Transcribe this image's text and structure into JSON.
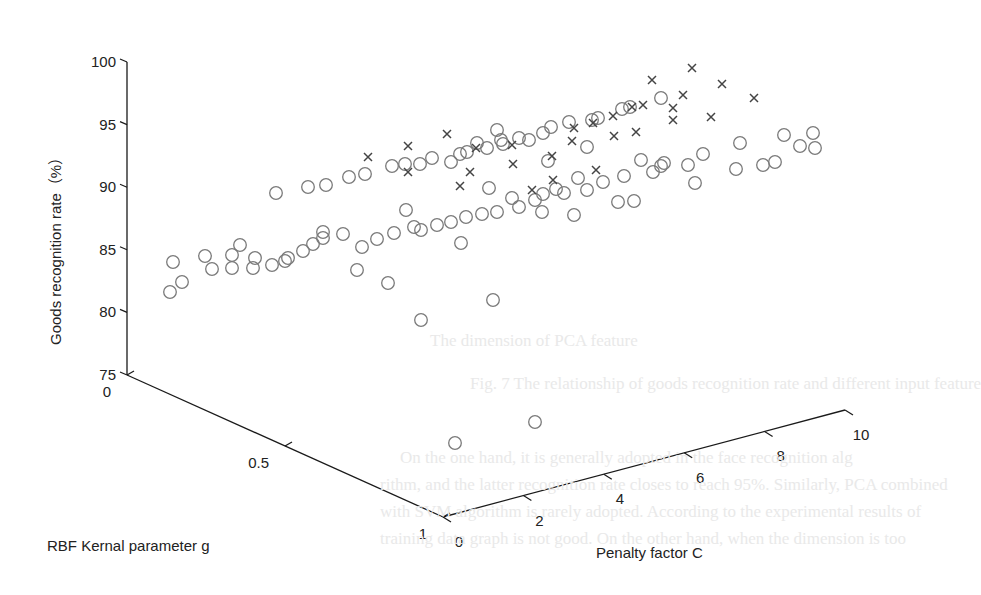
{
  "chart_data": {
    "type": "scatter",
    "projection": "3d",
    "title": "",
    "xlabel": "Penalty factor C",
    "ylabel": "RBF Kernal parameter g",
    "zlabel": "Goods recognition rate（%）",
    "x_ticks": [
      "0",
      "2",
      "4",
      "6",
      "8",
      "10"
    ],
    "y_ticks": [
      "0",
      "0.5",
      "1"
    ],
    "z_ticks": [
      "75",
      "80",
      "85",
      "90",
      "95",
      "100"
    ],
    "xlim": [
      0,
      10
    ],
    "ylim": [
      0,
      1
    ],
    "zlim": [
      75,
      100
    ],
    "grid": false,
    "legend": null,
    "marker_colors": {
      "circle": "#7a7a7a",
      "cross": "#444444",
      "axis": "#1a1a1a"
    },
    "series": [
      {
        "name": "circle-markers",
        "marker": "o",
        "screen_points": [
          [
            170,
            292
          ],
          [
            173,
            262
          ],
          [
            182,
            282
          ],
          [
            205,
            256
          ],
          [
            212,
            269
          ],
          [
            232,
            255
          ],
          [
            232,
            268
          ],
          [
            240,
            245
          ],
          [
            253,
            268
          ],
          [
            255,
            258
          ],
          [
            272,
            265
          ],
          [
            285,
            261
          ],
          [
            288,
            258
          ],
          [
            303,
            251
          ],
          [
            313,
            244
          ],
          [
            323,
            238
          ],
          [
            323,
            232
          ],
          [
            343,
            234
          ],
          [
            357,
            270
          ],
          [
            362,
            247
          ],
          [
            377,
            239
          ],
          [
            388,
            283
          ],
          [
            394,
            233
          ],
          [
            406,
            210
          ],
          [
            414,
            227
          ],
          [
            421,
            230
          ],
          [
            437,
            225
          ],
          [
            451,
            222
          ],
          [
            461,
            243
          ],
          [
            466,
            217
          ],
          [
            482,
            214
          ],
          [
            489,
            188
          ],
          [
            497,
            212
          ],
          [
            512,
            198
          ],
          [
            519,
            207
          ],
          [
            535,
            200
          ],
          [
            542,
            212
          ],
          [
            543,
            194
          ],
          [
            556,
            189
          ],
          [
            564,
            193
          ],
          [
            574,
            215
          ],
          [
            578,
            178
          ],
          [
            587,
            190
          ],
          [
            603,
            182
          ],
          [
            618,
            202
          ],
          [
            624,
            176
          ],
          [
            634,
            201
          ],
          [
            641,
            160
          ],
          [
            653,
            172
          ],
          [
            661,
            166
          ],
          [
            664,
            163
          ],
          [
            688,
            165
          ],
          [
            695,
            183
          ],
          [
            703,
            154
          ],
          [
            736,
            169
          ],
          [
            740,
            143
          ],
          [
            763,
            165
          ],
          [
            775,
            162
          ],
          [
            784,
            135
          ],
          [
            800,
            146
          ],
          [
            813,
            133
          ],
          [
            815,
            148
          ],
          [
            276,
            193
          ],
          [
            308,
            187
          ],
          [
            326,
            185
          ],
          [
            349,
            177
          ],
          [
            365,
            174
          ],
          [
            392,
            166
          ],
          [
            405,
            164
          ],
          [
            420,
            164
          ],
          [
            432,
            158
          ],
          [
            451,
            162
          ],
          [
            460,
            154
          ],
          [
            467,
            152
          ],
          [
            477,
            143
          ],
          [
            487,
            148
          ],
          [
            501,
            140
          ],
          [
            503,
            144
          ],
          [
            519,
            138
          ],
          [
            529,
            140
          ],
          [
            543,
            133
          ],
          [
            551,
            127
          ],
          [
            569,
            122
          ],
          [
            592,
            120
          ],
          [
            598,
            118
          ],
          [
            622,
            109
          ],
          [
            630,
            107
          ],
          [
            661,
            98
          ],
          [
            587,
            147
          ],
          [
            548,
            161
          ],
          [
            497,
            130
          ],
          [
            493,
            300
          ],
          [
            421,
            320
          ],
          [
            455,
            443
          ],
          [
            535,
            422
          ]
        ]
      },
      {
        "name": "cross-markers",
        "marker": "x",
        "screen_points": [
          [
            368,
            157
          ],
          [
            408,
            172
          ],
          [
            408,
            146
          ],
          [
            447,
            134
          ],
          [
            460,
            186
          ],
          [
            470,
            172
          ],
          [
            476,
            148
          ],
          [
            512,
            145
          ],
          [
            513,
            164
          ],
          [
            532,
            190
          ],
          [
            552,
            156
          ],
          [
            553,
            180
          ],
          [
            574,
            128
          ],
          [
            572,
            141
          ],
          [
            593,
            123
          ],
          [
            613,
            116
          ],
          [
            614,
            136
          ],
          [
            632,
            107
          ],
          [
            636,
            132
          ],
          [
            652,
            80
          ],
          [
            643,
            105
          ],
          [
            673,
            108
          ],
          [
            683,
            95
          ],
          [
            692,
            68
          ],
          [
            722,
            84
          ],
          [
            673,
            120
          ],
          [
            711,
            117
          ],
          [
            754,
            98
          ],
          [
            596,
            170
          ]
        ]
      }
    ]
  },
  "background_bleed": [
    {
      "text": "The dimension of PCA feature",
      "x": 430,
      "y": 345
    },
    {
      "text": "Fig. 7 The relationship of goods recognition rate and different input feature",
      "x": 470,
      "y": 388
    },
    {
      "text": "On the one hand, it is generally adopted in the face recognition alg",
      "x": 400,
      "y": 462
    },
    {
      "text": "rithm, and the latter recognition rate closes to reach 95%. Similarly, PCA combined",
      "x": 380,
      "y": 489
    },
    {
      "text": "with SVM algorithm is rarely adopted. According to the experimental results of",
      "x": 380,
      "y": 516
    },
    {
      "text": "training data graph is not good. On the other hand, when the dimension is too",
      "x": 380,
      "y": 543
    }
  ]
}
